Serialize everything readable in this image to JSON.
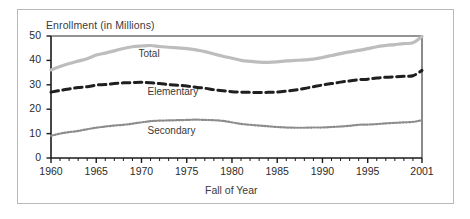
{
  "figure": {
    "background": "#ffffff",
    "outer_border_color": "#b9b9b9",
    "axis_color": "#1a1a1a"
  },
  "chart_data": {
    "type": "line",
    "title": "Enrollment (in Millions)",
    "xlabel": "Fall of Year",
    "ylabel": "",
    "xlim": [
      1960,
      2001
    ],
    "ylim": [
      0,
      50
    ],
    "grid": false,
    "legend_position": "inline-labels",
    "ytick_labels": [
      "0",
      "10",
      "20",
      "30",
      "40",
      "50"
    ],
    "ytick_values": [
      0,
      10,
      20,
      30,
      40,
      50
    ],
    "xtick_labels": [
      "1960",
      "1965",
      "1970",
      "1975",
      "1980",
      "1985",
      "1990",
      "1995",
      "2001"
    ],
    "xtick_values": [
      1960,
      1965,
      1970,
      1975,
      1980,
      1985,
      1990,
      1995,
      2001
    ],
    "minor_xticks_every": 1,
    "x": [
      1960,
      1961,
      1962,
      1963,
      1964,
      1965,
      1966,
      1967,
      1968,
      1969,
      1970,
      1971,
      1972,
      1973,
      1974,
      1975,
      1976,
      1977,
      1978,
      1979,
      1980,
      1981,
      1982,
      1983,
      1984,
      1985,
      1986,
      1987,
      1988,
      1989,
      1990,
      1991,
      1992,
      1993,
      1994,
      1995,
      1996,
      1997,
      1998,
      1999,
      2000,
      2001
    ],
    "series": [
      {
        "name": "Total",
        "color": "#bdbdbd",
        "style": "solid",
        "width": 3.2,
        "label_x": 1971,
        "label_y": 42.2,
        "values": [
          36.1,
          37.5,
          38.7,
          39.7,
          40.7,
          42.2,
          43.0,
          43.9,
          44.9,
          45.6,
          45.9,
          46.1,
          45.7,
          45.4,
          45.1,
          44.8,
          44.3,
          43.6,
          42.6,
          41.7,
          40.9,
          40.0,
          39.6,
          39.3,
          39.2,
          39.4,
          39.8,
          40.0,
          40.2,
          40.5,
          41.2,
          42.0,
          42.8,
          43.5,
          44.1,
          44.8,
          45.6,
          46.1,
          46.5,
          46.9,
          47.2,
          49.8
        ]
      },
      {
        "name": "Elementary",
        "color": "#1f1f1f",
        "style": "dashed",
        "width": 3.0,
        "label_x": 1972,
        "label_y": 26.8,
        "values": [
          27.0,
          27.7,
          28.3,
          28.9,
          29.2,
          29.9,
          30.1,
          30.5,
          30.8,
          30.9,
          31.0,
          30.8,
          30.5,
          30.1,
          29.8,
          29.5,
          29.0,
          28.6,
          28.0,
          27.6,
          27.2,
          27.0,
          26.9,
          26.8,
          26.9,
          27.0,
          27.4,
          27.9,
          28.5,
          29.2,
          29.9,
          30.5,
          31.1,
          31.6,
          32.1,
          32.3,
          32.8,
          33.1,
          33.3,
          33.5,
          33.7,
          35.9
        ]
      },
      {
        "name": "Secondary",
        "color": "#8c8c8c",
        "style": "dotted",
        "width": 2.2,
        "label_x": 1972,
        "label_y": 10.8,
        "values": [
          9.1,
          10.0,
          10.6,
          11.1,
          11.8,
          12.4,
          12.9,
          13.3,
          13.6,
          14.1,
          14.6,
          15.1,
          15.3,
          15.4,
          15.5,
          15.6,
          15.7,
          15.6,
          15.5,
          15.2,
          14.6,
          14.0,
          13.6,
          13.3,
          13.0,
          12.7,
          12.5,
          12.4,
          12.4,
          12.5,
          12.5,
          12.7,
          12.9,
          13.2,
          13.6,
          13.7,
          13.9,
          14.2,
          14.4,
          14.6,
          14.8,
          15.5
        ]
      }
    ]
  }
}
